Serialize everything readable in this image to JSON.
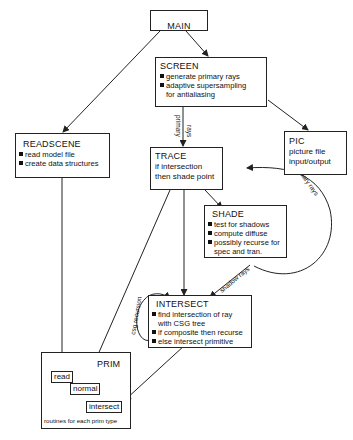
{
  "main": {
    "title": "MAIN"
  },
  "screen": {
    "title": "SCREEN",
    "items": [
      "generate primary rays",
      "adaptive supersampling",
      "for antialiasing"
    ]
  },
  "readscene": {
    "title": "READSCENE",
    "items": [
      "read model file",
      "create data structures"
    ]
  },
  "pic": {
    "title": "PIC",
    "lines": [
      "picture file",
      "input/output"
    ]
  },
  "trace": {
    "title": "TRACE",
    "lines": [
      "if intersection",
      "then shade point"
    ]
  },
  "shade": {
    "title": "SHADE",
    "items": [
      "test for shadows",
      "compute diffuse",
      "possibly recurse for",
      "spec and tran."
    ]
  },
  "intersect": {
    "title": "INTERSECT",
    "items": [
      "find intersection of ray",
      "with CSG tree",
      "if composite then recurse",
      "else intersect primitive"
    ]
  },
  "prim": {
    "title": "PRIM",
    "routines": [
      "read",
      "normal",
      "intersect"
    ],
    "caption": "routines for each prim type"
  },
  "edge_labels": {
    "primary_rays_1": "primary",
    "primary_rays_2": "rays",
    "secondary_rays": "secondary rays",
    "shadow_rays": "shadow rays",
    "csg_recursion": "csg recursion"
  }
}
